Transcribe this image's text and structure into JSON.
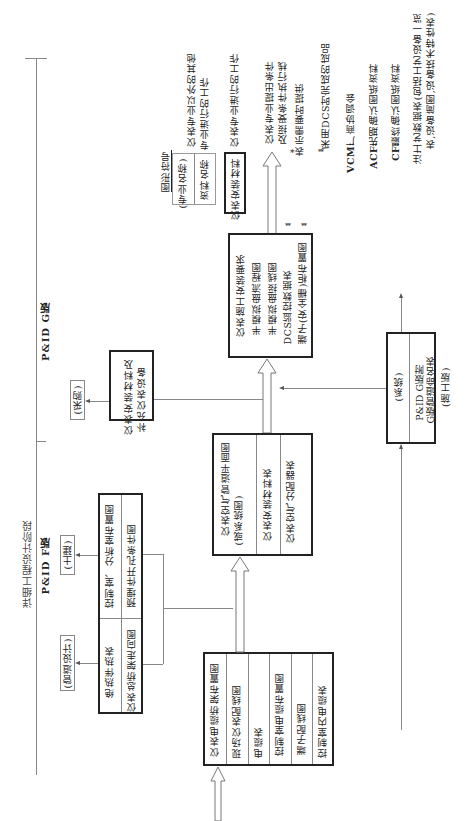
{
  "stage": {
    "title": "详细工程设计阶段",
    "pid_g": "P&ID G版",
    "pid_f": "P&ID F版"
  },
  "external_depts": {
    "purchasing": "(采购)",
    "civil": "(土建)",
    "piping": "(管道设计)"
  },
  "boxes": {
    "supplement": {
      "lines": [
        "仪表安装材料及",
        "补充仪表设备"
      ]
    },
    "civil_piping": {
      "civil_items": [
        "控制室、分析室布置图",
        "预埋件开孔条件图"
      ],
      "piping_items": [
        "绝热伴热表",
        "仪表总桥架走向图"
      ]
    },
    "cable": {
      "items": [
        "仪表电缆桥架布置图",
        "现场仪表配线图",
        "电缆表",
        "控制室电缆布置图",
        "端子配线图",
        "控制室内电缆表"
      ]
    },
    "air": {
      "items": [
        "仪表空气管道平面图",
        "(或系统图)",
        "仪表安装材料表",
        "仪表空气分配器表"
      ]
    },
    "main": {
      "items": [
        "仪表施工安装要求",
        "半模拟盘流程图",
        "半模拟盘接线图",
        "DCS监控数据表",
        "端子(安全栅)柜布置图"
      ],
      "markers": [
        "**",
        "**"
      ]
    },
    "system": {
      "header": "(系统)",
      "lines": [
        "P&ID G版附",
        "G版管道命名表"
      ],
      "footer": "(施工版)"
    }
  },
  "legend": {
    "title": "图形符号",
    "thin_box": [
      "(专业名称)",
      "资料名称"
    ],
    "thick_box": "仪表安装材料",
    "thin_desc": [
      "仪表专业以外的其他",
      "专业进行的工作"
    ],
    "thick_desc": "仪表专业进行的工作",
    "arrow_desc": [
      "仪表专业提出条件",
      "及接受条件执行栈"
    ],
    "star_symbol": "*",
    "star_desc": "表示需要时提供",
    "double_star_symbol": "**",
    "double_star_desc": "采用DCS时完成的成品",
    "abbreviations": [
      {
        "key": "VCM:",
        "value": "厂商协调会"
      },
      {
        "key": "ACF:",
        "value": "先期确认图纸资料"
      },
      {
        "key": "CF:",
        "value": "最终确认图纸资料"
      }
    ],
    "note_label": "注:",
    "note_lines": [
      "工艺数据表(包括工艺设备一览",
      "表,设备简图,设备技术特性表)"
    ]
  }
}
